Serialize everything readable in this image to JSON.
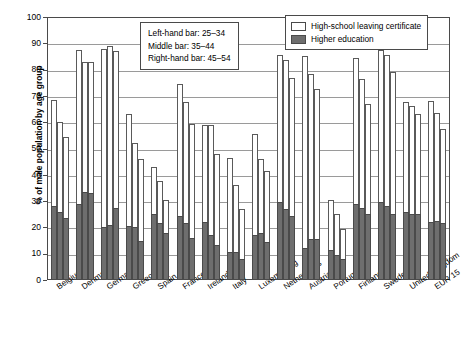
{
  "chart_data": {
    "type": "bar",
    "title": "",
    "xlabel": "",
    "ylabel": "% of male population by age group",
    "ylim": [
      0,
      100
    ],
    "yticks": [
      0,
      10,
      20,
      30,
      40,
      50,
      60,
      70,
      80,
      90,
      100
    ],
    "grid": true,
    "legend_position": "top-right",
    "categories": [
      "Belgium",
      "Denmark",
      "Germany",
      "Greece",
      "Spain",
      "France",
      "Ireland",
      "Italy",
      "Luxembourg",
      "Netherlands",
      "Austria",
      "Portugal",
      "Finland",
      "Sweden",
      "United Kingdom",
      "EUR 15"
    ],
    "age_groups": [
      "25-34",
      "35-44",
      "45-54"
    ],
    "series": [
      {
        "name": "High-school leaving certificate",
        "color": "#ffffff",
        "values_by_age": {
          "25-34": [
            68.5,
            87.5,
            88.0,
            63.0,
            43.0,
            74.5,
            59.0,
            46.5,
            55.5,
            85.5,
            85.0,
            30.5,
            84.5,
            87.5,
            67.5,
            68.0
          ],
          "35-44": [
            60.0,
            83.0,
            89.0,
            52.0,
            37.5,
            67.5,
            59.0,
            36.0,
            46.0,
            83.5,
            78.5,
            25.0,
            76.5,
            85.5,
            66.0,
            63.5
          ],
          "45-54": [
            54.5,
            83.0,
            87.0,
            46.0,
            30.5,
            59.5,
            48.0,
            27.0,
            41.5,
            77.0,
            72.5,
            19.5,
            67.0,
            79.0,
            63.0,
            57.5
          ]
        }
      },
      {
        "name": "Higher education",
        "color": "#6e6e6e",
        "values_by_age": {
          "25-34": [
            28.0,
            29.0,
            20.0,
            20.5,
            25.0,
            24.5,
            22.0,
            10.5,
            17.0,
            29.5,
            12.0,
            11.5,
            29.0,
            29.5,
            26.0,
            22.0
          ],
          "35-44": [
            26.0,
            33.5,
            21.0,
            20.0,
            21.5,
            21.5,
            17.0,
            10.5,
            18.0,
            27.0,
            15.5,
            9.5,
            27.5,
            28.0,
            25.0,
            22.5
          ],
          "45-54": [
            23.5,
            33.0,
            27.5,
            15.0,
            18.0,
            16.0,
            13.5,
            8.0,
            14.5,
            24.5,
            15.5,
            8.0,
            25.0,
            25.0,
            25.0,
            21.5
          ]
        }
      }
    ],
    "annotations": [
      "Left-hand bar: 25–34",
      "Middle bar: 35–44",
      "Right-hand bar: 45–54"
    ]
  },
  "legend": {
    "items": [
      {
        "label": "High-school leaving certificate",
        "style": "white"
      },
      {
        "label": "Higher education",
        "style": "dark"
      }
    ]
  },
  "axis": {
    "y_title": "% of male population by age group",
    "y_tick_labels": [
      "100",
      "90",
      "80",
      "70",
      "60",
      "50",
      "40",
      "30",
      "20",
      "10",
      "0"
    ]
  },
  "colors": {
    "bar_white": "#ffffff",
    "bar_dark": "#6e6e6e",
    "frame": "#4a4a4a",
    "grid": "#9a9a9a"
  }
}
